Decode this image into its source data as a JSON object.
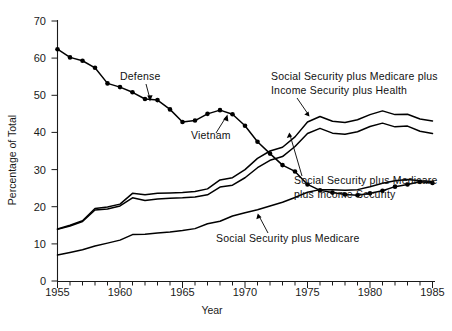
{
  "chart_data": {
    "type": "line",
    "title": "",
    "xlabel": "Year",
    "ylabel": "Percentage of Total",
    "xlim": [
      1955,
      1985
    ],
    "ylim": [
      0,
      70
    ],
    "grid": false,
    "legend_position": "inline-annotations",
    "x_tick_labels": [
      "1955",
      "1960",
      "1965",
      "1970",
      "1975",
      "1980",
      "1985"
    ],
    "x_major_ticks": [
      1955,
      1960,
      1965,
      1970,
      1975,
      1980,
      1985
    ],
    "x_minor_tick_interval": 1,
    "y_tick_labels": [
      "0",
      "10",
      "20",
      "30",
      "40",
      "50",
      "60",
      "70"
    ],
    "y_major_ticks": [
      0,
      10,
      20,
      30,
      40,
      50,
      60,
      70
    ],
    "x": [
      1955,
      1956,
      1957,
      1958,
      1959,
      1960,
      1961,
      1962,
      1963,
      1964,
      1965,
      1966,
      1967,
      1968,
      1969,
      1970,
      1971,
      1972,
      1973,
      1974,
      1975,
      1976,
      1977,
      1978,
      1979,
      1980,
      1981,
      1982,
      1983,
      1984,
      1985
    ],
    "series": [
      {
        "name": "Defense",
        "markers": true,
        "annotation": "Defense",
        "values": [
          62.4,
          60.2,
          59.3,
          57.4,
          53.2,
          52.2,
          50.8,
          49.0,
          48.7,
          46.2,
          42.8,
          43.2,
          45.0,
          46.0,
          44.9,
          41.8,
          37.5,
          34.3,
          31.2,
          29.5,
          26.0,
          24.4,
          23.8,
          23.3,
          23.1,
          23.6,
          24.3,
          25.4,
          26.0,
          26.7,
          26.4
        ]
      },
      {
        "name": "Social Security plus Medicare plus Income Security plus Health",
        "markers": false,
        "annotation": "Social Security plus Medicare plus Income Security plus Health",
        "values": [
          14.0,
          15.0,
          16.2,
          19.5,
          19.9,
          20.7,
          23.6,
          23.2,
          23.6,
          23.7,
          23.8,
          24.1,
          24.8,
          27.2,
          27.8,
          30.0,
          33.0,
          35.0,
          36.0,
          38.8,
          42.8,
          44.3,
          43.0,
          42.7,
          43.4,
          44.8,
          45.8,
          44.8,
          44.9,
          43.6,
          43.1
        ]
      },
      {
        "name": "Social Security plus Medicare plus Income Security",
        "markers": false,
        "annotation": "Social Security plus Medicare plus Income Security",
        "values": [
          13.9,
          14.8,
          16.0,
          19.1,
          19.4,
          20.2,
          22.4,
          21.7,
          22.1,
          22.3,
          22.4,
          22.6,
          23.2,
          25.3,
          25.8,
          27.8,
          30.5,
          32.5,
          33.5,
          36.2,
          39.7,
          41.1,
          39.8,
          39.5,
          40.2,
          41.6,
          42.5,
          41.5,
          41.7,
          40.3,
          39.7
        ]
      },
      {
        "name": "Social Security plus Medicare",
        "markers": false,
        "annotation": "Social Security plus Medicare",
        "values": [
          7.0,
          7.7,
          8.4,
          9.4,
          10.2,
          11.0,
          12.5,
          12.6,
          12.9,
          13.2,
          13.6,
          14.1,
          15.4,
          16.1,
          17.5,
          18.4,
          19.2,
          20.2,
          21.2,
          22.5,
          23.9,
          24.6,
          24.6,
          24.4,
          24.6,
          25.4,
          26.3,
          27.0,
          27.3,
          27.0,
          26.8
        ]
      }
    ],
    "annotations": [
      {
        "id": "defense",
        "text": "Defense"
      },
      {
        "id": "vietnam",
        "text": "Vietnam"
      },
      {
        "id": "ss-med-inc-health-line1",
        "text": "Social Security plus Medicare plus"
      },
      {
        "id": "ss-med-inc-health-line2",
        "text": "Income Security plus Health"
      },
      {
        "id": "ss-med-inc-line1",
        "text": "Social Security plus Medicare"
      },
      {
        "id": "ss-med-inc-line2",
        "text": "plus Income Security"
      },
      {
        "id": "ss-med",
        "text": "Social Security plus Medicare"
      }
    ]
  },
  "colors": {
    "line": "#000000",
    "axis": "#1a1a1a",
    "background": "#ffffff",
    "text": "#111111"
  }
}
